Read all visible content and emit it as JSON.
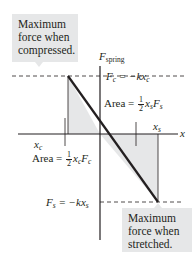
{
  "diagram": {
    "callouts": {
      "compressed": {
        "line1": "Maximum",
        "line2": "force when",
        "line3": "compressed."
      },
      "stretched": {
        "line1": "Maximum",
        "line2": "force when",
        "line3": "stretched."
      }
    },
    "axes": {
      "y_label_main": "F",
      "y_label_sub": "spring",
      "x_label": "x"
    },
    "labels": {
      "Fc_eq": {
        "lhs": "F",
        "lhs_sub": "c",
        "rhs": " = −kx",
        "rhs_sub": "c"
      },
      "Fs_eq": {
        "lhs": "F",
        "lhs_sub": "s",
        "rhs": " = −kx",
        "rhs_sub": "s"
      },
      "xc": {
        "main": "x",
        "sub": "c"
      },
      "xs": {
        "main": "x",
        "sub": "s"
      },
      "area_s": {
        "prefix": "Area = ",
        "num": "1",
        "den": "2",
        "v1": "x",
        "v1_sub": "s",
        "v2": "F",
        "v2_sub": "s"
      },
      "area_c": {
        "prefix": "Area = ",
        "num": "1",
        "den": "2",
        "v1": "x",
        "v1_sub": "c",
        "v2": "F",
        "v2_sub": "c"
      }
    },
    "colors": {
      "fill": "#e6e7e8",
      "line": "#231f20",
      "callout_bg": "#e6e7e8"
    }
  }
}
